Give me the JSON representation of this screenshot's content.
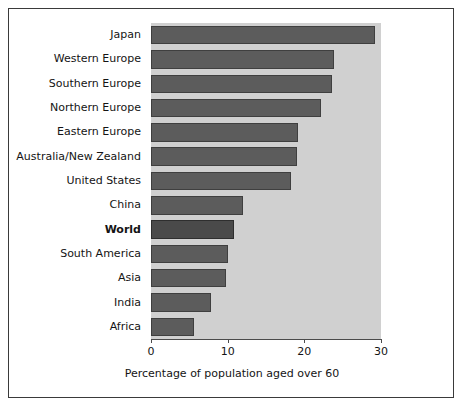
{
  "chart_data": {
    "type": "bar",
    "orientation": "horizontal",
    "title": "",
    "subtitle": "",
    "xlabel": "Percentage of population aged over 60",
    "ylabel": "",
    "xlim": [
      0,
      30
    ],
    "xticks": [
      "0",
      "10",
      "20",
      "30"
    ],
    "xtick_values": [
      0,
      10,
      20,
      30
    ],
    "grid": false,
    "legend": false,
    "categories": [
      "Japan",
      "Western Europe",
      "Southern Europe",
      "Northern Europe",
      "Eastern Europe",
      "Australia/New Zealand",
      "United States",
      "China",
      "World",
      "South America",
      "Asia",
      "India",
      "Africa"
    ],
    "values": [
      29.2,
      23.9,
      23.6,
      22.2,
      19.2,
      19.0,
      18.2,
      12.0,
      10.8,
      10.1,
      9.8,
      7.8,
      5.6
    ],
    "highlight_category": "World",
    "colors": {
      "bar_fill": "#5c5c5c",
      "bar_highlight_fill": "#4a4a4a",
      "bar_edge": "#3f3f3f",
      "plot_background": "#d0d0d0",
      "figure_background": "#ffffff",
      "figure_border": "#3a3a3a",
      "axis": "#4b4b4b",
      "text": "#141414"
    }
  }
}
